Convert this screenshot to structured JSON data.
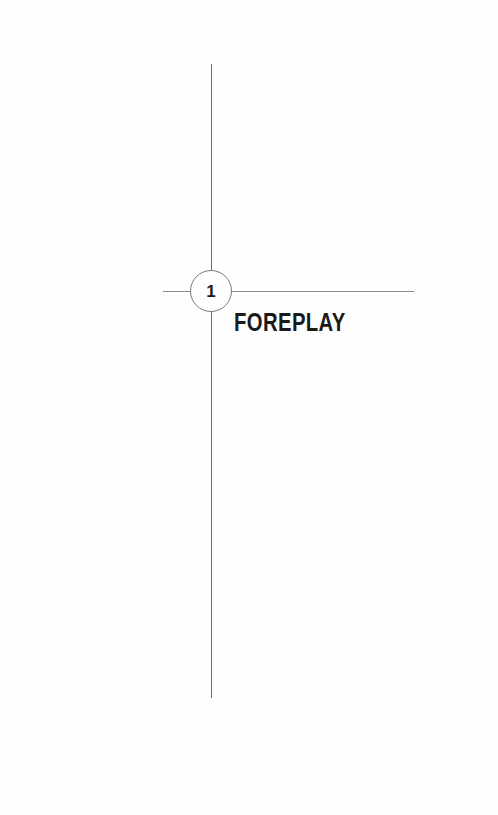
{
  "chapter": {
    "number": "1",
    "title": "FOREPLAY"
  },
  "colors": {
    "background": "#fefefe",
    "rule": "#6e6e6e",
    "text": "#1a1a1a"
  }
}
